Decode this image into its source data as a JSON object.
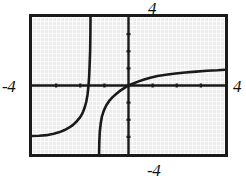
{
  "figure": {
    "kind": "graphing-calculator-screen",
    "background_color": "#ffffff",
    "screen_color": "#ececec",
    "ink_color": "#1a1a1a",
    "frame_color": "#1a1a1a"
  },
  "labels": {
    "top": "4",
    "bottom": "-4",
    "left": "-4",
    "right": "4"
  },
  "chart_data": {
    "type": "line",
    "title": "",
    "xlabel": "",
    "ylabel": "",
    "xlim": [
      -4,
      4
    ],
    "ylim": [
      -4,
      4
    ],
    "grid": false,
    "legend": null,
    "x_tick_labels": [
      "-4",
      "4"
    ],
    "y_tick_labels": [
      "-4",
      "4"
    ],
    "x_ticks": [
      -3,
      -2,
      -1,
      1,
      2,
      3
    ],
    "y_ticks": [
      -3,
      -2,
      -1,
      1,
      2,
      3
    ],
    "tick_mark_length": 4,
    "axes_drawn": [
      "x-axis",
      "y-axis"
    ],
    "asymptotes": [
      {
        "type": "vertical",
        "x": -1.55
      }
    ],
    "series": [
      {
        "name": "left-branch",
        "comment": "flat near y = -2.95 at x = -4, rising slowly then steeply up to the top of the window at x = -1.6",
        "points": [
          [
            -4.0,
            -2.95
          ],
          [
            -3.7,
            -2.93
          ],
          [
            -3.4,
            -2.9
          ],
          [
            -3.1,
            -2.82
          ],
          [
            -2.85,
            -2.72
          ],
          [
            -2.65,
            -2.6
          ],
          [
            -2.45,
            -2.45
          ],
          [
            -2.3,
            -2.3
          ],
          [
            -2.15,
            -2.1
          ],
          [
            -2.0,
            -1.85
          ],
          [
            -1.9,
            -1.6
          ],
          [
            -1.82,
            -1.3
          ],
          [
            -1.75,
            -0.95
          ],
          [
            -1.7,
            -0.55
          ],
          [
            -1.66,
            -0.05
          ],
          [
            -1.63,
            0.55
          ],
          [
            -1.61,
            1.25
          ],
          [
            -1.59,
            2.05
          ],
          [
            -1.58,
            2.95
          ],
          [
            -1.575,
            4.0
          ]
        ]
      },
      {
        "name": "middle-branch",
        "comment": "rises out of the bottom of the window near x = -1.25, passes through the origin",
        "points": [
          [
            -1.22,
            -4.0
          ],
          [
            -1.21,
            -3.3
          ],
          [
            -1.19,
            -2.7
          ],
          [
            -1.15,
            -2.2
          ],
          [
            -1.1,
            -1.8
          ],
          [
            -1.02,
            -1.45
          ],
          [
            -0.92,
            -1.15
          ],
          [
            -0.8,
            -0.9
          ],
          [
            -0.66,
            -0.68
          ],
          [
            -0.5,
            -0.48
          ],
          [
            -0.34,
            -0.3
          ],
          [
            -0.18,
            -0.15
          ],
          [
            0.0,
            0.0
          ]
        ]
      },
      {
        "name": "right-branch",
        "comment": "rises gently to the right of the origin, flattening near y = 0.9 at x = 4",
        "points": [
          [
            0.0,
            0.0
          ],
          [
            0.2,
            0.12
          ],
          [
            0.42,
            0.24
          ],
          [
            0.65,
            0.35
          ],
          [
            0.9,
            0.45
          ],
          [
            1.2,
            0.55
          ],
          [
            1.55,
            0.63
          ],
          [
            1.95,
            0.7
          ],
          [
            2.35,
            0.76
          ],
          [
            2.8,
            0.81
          ],
          [
            3.25,
            0.86
          ],
          [
            3.7,
            0.89
          ],
          [
            4.0,
            0.92
          ]
        ]
      }
    ]
  }
}
